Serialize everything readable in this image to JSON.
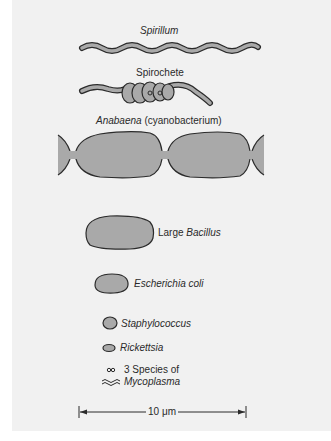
{
  "figure": {
    "organisms": [
      {
        "name": "Spirillum",
        "italic": true
      },
      {
        "name": "Spirochete",
        "italic": false
      },
      {
        "name_italic": "Anabaena",
        "name_suffix": " (cyanobacterium)"
      },
      {
        "prefix": "Large ",
        "name_italic": "Bacillus"
      },
      {
        "name": "Escherichia coli",
        "italic": true
      },
      {
        "name": "Staphylococcus",
        "italic": true
      },
      {
        "name": "Rickettsia",
        "italic": true
      },
      {
        "line1": "3 Species of",
        "line2": "Mycoplasma"
      }
    ],
    "scale_bar": {
      "label": "10 μm"
    },
    "colors": {
      "cell_fill": "#a9a9a9",
      "outline": "#2b2b2b",
      "background": "#f1f1f1"
    }
  }
}
